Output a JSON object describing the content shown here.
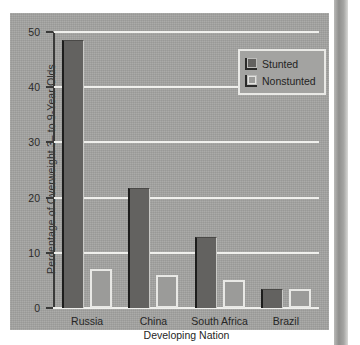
{
  "chart_data": {
    "type": "bar",
    "title": "",
    "xlabel": "Developing Nation",
    "ylabel": "Percentage of Overweight 3– to 9-Year Olds",
    "categories": [
      "Russia",
      "China",
      "South Africa",
      "Brazil"
    ],
    "series": [
      {
        "name": "Stunted",
        "values": [
          48.5,
          21.7,
          12.8,
          3.5
        ],
        "color": "#636260"
      },
      {
        "name": "Nonstunted",
        "values": [
          7.0,
          6.0,
          5.0,
          3.5
        ],
        "color": "#9b9b99"
      }
    ],
    "ylim": [
      0,
      50
    ],
    "yticks": [
      0,
      10,
      20,
      30,
      40,
      50
    ],
    "ytick_labels": [
      "0",
      "10",
      "20",
      "30",
      "40",
      "50"
    ],
    "grid": true,
    "legend_position": "top-right",
    "legend_entries": [
      "Stunted",
      "Nonstunted"
    ],
    "background_color": "#a3a3a1",
    "gridline_color": "#efefec"
  }
}
